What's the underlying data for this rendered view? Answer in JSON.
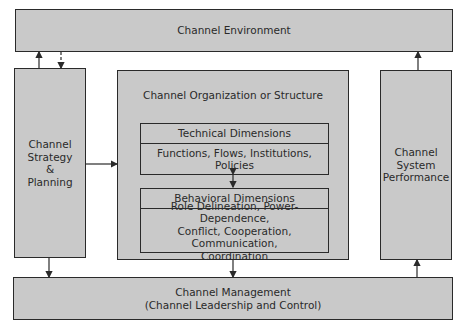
{
  "diagram": {
    "environment": "Channel Environment",
    "strategy": "Channel\nStrategy\n&\nPlanning",
    "organization": {
      "title": "Channel Organization or Structure",
      "technical": {
        "header": "Technical Dimensions",
        "body": "Functions, Flows, Institutions,\nPolicies"
      },
      "behavioral": {
        "header": "Behavioral Dimensions",
        "body": "Role Delineation, Power-Dependence,\nConflict, Cooperation, Communication,\nCoordination"
      }
    },
    "performance": "Channel\nSystem\nPerformance",
    "management": "Channel Management\n(Channel Leadership and Control)"
  }
}
